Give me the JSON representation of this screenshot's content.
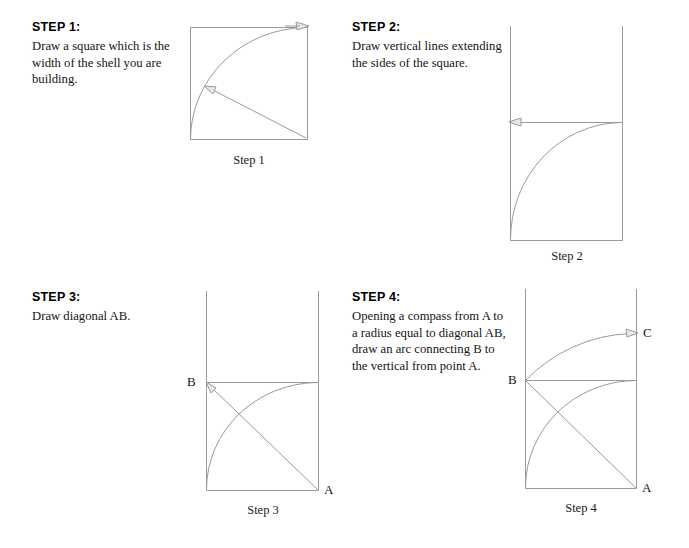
{
  "page": {
    "title": "Shell construction layout steps",
    "line_color": "#9a9a9a",
    "text_color": "#141414",
    "background": "#ffffff"
  },
  "steps": [
    {
      "id": "step-1",
      "heading": "STEP 1:",
      "body": "Draw a square which is the width of the shell you are building.",
      "caption": "Step 1",
      "labels": [],
      "figure": {
        "type": "square-with-arc",
        "square": {
          "left": 190,
          "top": 27,
          "right": 308,
          "bottom": 140
        },
        "arc": {
          "center": "bottom-left",
          "from": "bottom-left",
          "to": "top-right"
        },
        "arrows": [
          "top-right-pointing-right",
          "radius-pointing-up-left"
        ]
      }
    },
    {
      "id": "step-2",
      "heading": "STEP 2:",
      "body": "Draw vertical lines extending the sides of the square.",
      "caption": "Step 2",
      "labels": [],
      "figure": {
        "type": "square-with-verticals",
        "square": {
          "left": 510,
          "top": 122,
          "right": 623,
          "bottom": 240
        },
        "verticals_top": 26,
        "arrows": [
          "horizontal-pointing-left"
        ]
      }
    },
    {
      "id": "step-3",
      "heading": "STEP 3:",
      "body": "Draw diagonal AB.",
      "caption": "Step 3",
      "labels": [
        {
          "text": "B",
          "position": "top-left"
        },
        {
          "text": "A",
          "position": "bottom-right"
        }
      ],
      "figure": {
        "type": "square-with-diagonal",
        "square": {
          "left": 206,
          "top": 382,
          "right": 319,
          "bottom": 490
        },
        "verticals_top": 291,
        "diagonal": "A-to-B",
        "arrows": [
          "diagonal-pointing-up-left-at-B"
        ]
      }
    },
    {
      "id": "step-4",
      "heading": "STEP 4:",
      "body": "Opening a compass from A to a radius equal to diagonal AB, draw an arc connecting B to the vertical from point A.",
      "caption": "Step 4",
      "labels": [
        {
          "text": "B",
          "position": "top-left"
        },
        {
          "text": "A",
          "position": "bottom-right"
        },
        {
          "text": "C",
          "position": "upper-right-on-vertical"
        }
      ],
      "figure": {
        "type": "square-with-compass-arc",
        "square": {
          "left": 525,
          "top": 380,
          "right": 636,
          "bottom": 488
        },
        "verticals_top": 289,
        "big_arc": {
          "from": "B",
          "to": "C",
          "center": "A"
        },
        "arrows": [
          "big-arc-pointing-right-at-C"
        ]
      }
    }
  ]
}
